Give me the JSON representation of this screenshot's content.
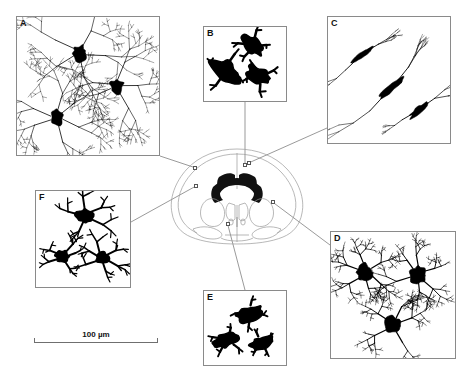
{
  "figure": {
    "type": "scientific-figure",
    "background_color": "#ffffff",
    "ink_color": "#000000",
    "box_border_color": "#8a8a8a",
    "leader_color": "#6f6f6f",
    "width": 472,
    "height": 372
  },
  "scale_bar": {
    "label": "100 µm",
    "x": 34,
    "y": 330,
    "length": 124,
    "color": "#6f6f6f"
  },
  "atlas": {
    "name": "coronal-brain-section",
    "x": 163,
    "y": 143,
    "width": 148,
    "height": 110,
    "outline_color": "#9a9a9a",
    "dark_structure_color": "#111111",
    "markers": [
      {
        "name": "marker-cortex-left",
        "x": 194.5,
        "y": 167.5,
        "panel": "A"
      },
      {
        "name": "marker-corpus-callosum-midline",
        "x": 245.0,
        "y": 164.5,
        "panel": "B"
      },
      {
        "name": "marker-corpus-callosum-right",
        "x": 248.5,
        "y": 163.0,
        "panel": "C"
      },
      {
        "name": "marker-striatum-right",
        "x": 272.5,
        "y": 202.0,
        "panel": "D"
      },
      {
        "name": "marker-ventral-hypothalamus",
        "x": 227.5,
        "y": 223.5,
        "panel": "E"
      },
      {
        "name": "marker-cortex-left-lower",
        "x": 196.0,
        "y": 186.0,
        "panel": "F"
      }
    ]
  },
  "panels": [
    {
      "id": "A",
      "label": "A",
      "x": 16,
      "y": 16,
      "width": 144,
      "height": 140,
      "morphology": "highly-ramified",
      "cell_count": 3,
      "soma_radius": 7.5,
      "branch_depth": 6,
      "branch_length": 17,
      "branch_spread": 1.05,
      "line_width": 0.8,
      "elongation": 1.0,
      "axis_deg": 0,
      "seed": 1207,
      "cells": [
        {
          "cx": 0.44,
          "cy": 0.26,
          "scale": 1.05,
          "rot": 15
        },
        {
          "cx": 0.7,
          "cy": 0.5,
          "scale": 1.0,
          "rot": 140
        },
        {
          "cx": 0.28,
          "cy": 0.73,
          "scale": 1.0,
          "rot": 265
        }
      ],
      "leader": {
        "from_x": 160,
        "from_y": 156,
        "to_x": 194.5,
        "to_y": 167.5
      }
    },
    {
      "id": "B",
      "label": "B",
      "x": 203,
      "y": 26,
      "width": 84,
      "height": 76,
      "morphology": "amoeboid",
      "cell_count": 3,
      "soma_radius": 10.5,
      "branch_depth": 2,
      "branch_length": 7,
      "branch_spread": 1.35,
      "line_width": 2.6,
      "elongation": 1.45,
      "axis_deg": 35,
      "seed": 4411,
      "cells": [
        {
          "cx": 0.6,
          "cy": 0.24,
          "scale": 0.92,
          "rot": 20
        },
        {
          "cx": 0.26,
          "cy": 0.58,
          "scale": 1.12,
          "rot": 125
        },
        {
          "cx": 0.68,
          "cy": 0.66,
          "scale": 0.95,
          "rot": 250
        }
      ],
      "leader": {
        "from_x": 245,
        "from_y": 102,
        "to_x": 245,
        "to_y": 164.5
      }
    },
    {
      "id": "C",
      "label": "C",
      "x": 327,
      "y": 16,
      "width": 124,
      "height": 128,
      "morphology": "elongated-bipolar",
      "cell_count": 3,
      "soma_radius": 5.0,
      "branch_depth": 5,
      "branch_length": 21,
      "branch_spread": 0.55,
      "line_width": 0.9,
      "elongation": 2.6,
      "axis_deg": -40,
      "seed": 8822,
      "cells": [
        {
          "cx": 0.28,
          "cy": 0.3,
          "scale": 0.95,
          "rot": 0
        },
        {
          "cx": 0.52,
          "cy": 0.56,
          "scale": 1.15,
          "rot": 0
        },
        {
          "cx": 0.74,
          "cy": 0.74,
          "scale": 0.95,
          "rot": 0
        }
      ],
      "leader": {
        "from_x": 327,
        "from_y": 128,
        "to_x": 248.5,
        "to_y": 163
      }
    },
    {
      "id": "D",
      "label": "D",
      "x": 330,
      "y": 231,
      "width": 126,
      "height": 128,
      "morphology": "bushy-radial",
      "cell_count": 3,
      "soma_radius": 8.5,
      "branch_depth": 5,
      "branch_length": 12,
      "branch_spread": 1.25,
      "line_width": 1.2,
      "elongation": 1.0,
      "axis_deg": 0,
      "seed": 3310,
      "cells": [
        {
          "cx": 0.28,
          "cy": 0.32,
          "scale": 1.0,
          "rot": 30
        },
        {
          "cx": 0.7,
          "cy": 0.34,
          "scale": 1.05,
          "rot": 160
        },
        {
          "cx": 0.5,
          "cy": 0.74,
          "scale": 1.05,
          "rot": 280
        }
      ],
      "leader": {
        "from_x": 330,
        "from_y": 245,
        "to_x": 272.5,
        "to_y": 202
      }
    },
    {
      "id": "E",
      "label": "E",
      "x": 203,
      "y": 290,
      "width": 84,
      "height": 76,
      "morphology": "amoeboid",
      "cell_count": 3,
      "soma_radius": 9.5,
      "branch_depth": 2,
      "branch_length": 6,
      "branch_spread": 1.3,
      "line_width": 2.4,
      "elongation": 1.5,
      "axis_deg": -20,
      "seed": 6655,
      "cells": [
        {
          "cx": 0.56,
          "cy": 0.3,
          "scale": 1.0,
          "rot": 10
        },
        {
          "cx": 0.28,
          "cy": 0.66,
          "scale": 1.0,
          "rot": 115
        },
        {
          "cx": 0.7,
          "cy": 0.7,
          "scale": 0.9,
          "rot": 235
        }
      ],
      "leader": {
        "from_x": 245,
        "from_y": 290,
        "to_x": 227.5,
        "to_y": 223.5
      }
    },
    {
      "id": "F",
      "label": "F",
      "x": 35,
      "y": 190,
      "width": 96,
      "height": 98,
      "morphology": "stout-intermediate",
      "cell_count": 3,
      "soma_radius": 7.0,
      "branch_depth": 3,
      "branch_length": 11,
      "branch_spread": 1.15,
      "line_width": 2.0,
      "elongation": 1.15,
      "axis_deg": 10,
      "seed": 9104,
      "cells": [
        {
          "cx": 0.52,
          "cy": 0.26,
          "scale": 1.1,
          "rot": 40
        },
        {
          "cx": 0.28,
          "cy": 0.68,
          "scale": 0.9,
          "rot": 150
        },
        {
          "cx": 0.7,
          "cy": 0.7,
          "scale": 0.95,
          "rot": 255
        }
      ],
      "leader": {
        "from_x": 131,
        "from_y": 222,
        "to_x": 196,
        "to_y": 186
      }
    }
  ]
}
